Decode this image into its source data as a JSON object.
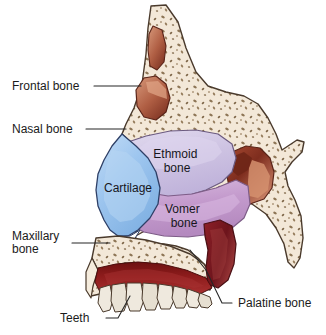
{
  "figure": {
    "width": 326,
    "height": 335,
    "background": "#ffffff"
  },
  "labels": {
    "external": [
      {
        "id": "frontal-bone",
        "text": "Frontal bone",
        "lines": [
          "Frontal bone"
        ],
        "x": 12,
        "y": 90,
        "anchor": "start"
      },
      {
        "id": "nasal-bone",
        "text": "Nasal bone",
        "lines": [
          "Nasal bone"
        ],
        "x": 12,
        "y": 133,
        "anchor": "start"
      },
      {
        "id": "maxillary-bone",
        "text": "Maxillary bone",
        "lines": [
          "Maxillary",
          "bone"
        ],
        "x": 12,
        "y": 245,
        "anchor": "start"
      },
      {
        "id": "teeth",
        "text": "Teeth",
        "lines": [
          "Teeth"
        ],
        "x": 70,
        "y": 322,
        "anchor": "start"
      },
      {
        "id": "palatine-bone",
        "text": "Palatine bone",
        "lines": [
          "Palatine bone"
        ],
        "x": 236,
        "y": 306,
        "anchor": "start"
      }
    ],
    "internal": [
      {
        "id": "ethmoid-bone",
        "text": "Ethmoid bone",
        "lines": [
          "Ethmoid",
          "bone"
        ],
        "x": 177,
        "y": 160
      },
      {
        "id": "cartilage",
        "text": "Cartilage",
        "lines": [
          "Cartilage"
        ],
        "x": 95,
        "y": 192
      },
      {
        "id": "vomer-bone",
        "text": "Vomer bone",
        "lines": [
          "Vomer",
          "bone"
        ],
        "x": 183,
        "y": 217
      }
    ]
  },
  "colors": {
    "bone_fill": "#f2e6d6",
    "bone_speckle": "#8a7355",
    "bone_outline": "#4a3a2c",
    "cartilage": "#8fbdea",
    "cartilage_light": "#bcd9f4",
    "ethmoid": "#cdc2e2",
    "ethmoid_light": "#ded6ee",
    "vomer": "#c49bcd",
    "vomer_light": "#d7b5de",
    "sinus_dark": "#7c2f22",
    "sinus_mid": "#a85440",
    "sinus_light": "#d99577",
    "gum": "#8e1c1c",
    "gum_dark": "#6b1212",
    "palatine": "#7d1a22",
    "tooth": "#efe9de",
    "label_text": "#1b1b1b",
    "leader_line": "#262626"
  },
  "regions": [
    {
      "id": "frontal-bone-region",
      "name": "frontal-bone",
      "label": "Frontal bone"
    },
    {
      "id": "nasal-bone-region",
      "name": "nasal-bone",
      "label": "Nasal bone"
    },
    {
      "id": "cartilage-region",
      "name": "cartilage",
      "label": "Cartilage"
    },
    {
      "id": "ethmoid-bone-region",
      "name": "ethmoid-bone",
      "label": "Ethmoid bone"
    },
    {
      "id": "vomer-bone-region",
      "name": "vomer-bone",
      "label": "Vomer bone"
    },
    {
      "id": "maxillary-bone-region",
      "name": "maxillary-bone",
      "label": "Maxillary bone"
    },
    {
      "id": "palatine-bone-region",
      "name": "palatine-bone",
      "label": "Palatine bone"
    },
    {
      "id": "teeth-region",
      "name": "teeth",
      "label": "Teeth"
    },
    {
      "id": "frontal-sinus",
      "name": "frontal-sinus",
      "label": ""
    },
    {
      "id": "sphenoid-sinus",
      "name": "sphenoid-sinus",
      "label": ""
    }
  ]
}
